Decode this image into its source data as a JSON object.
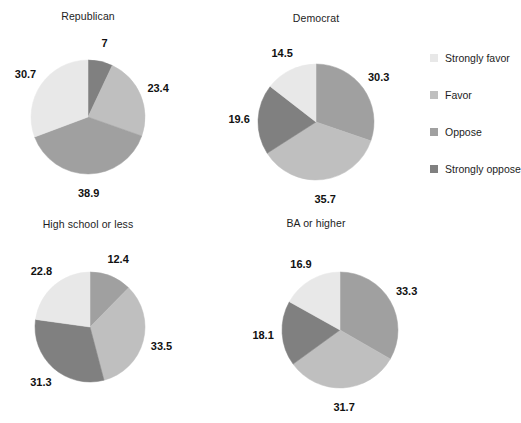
{
  "chart_data": {
    "type": "pie",
    "title": "",
    "legend_position": "right",
    "legend": {
      "entries": [
        {
          "label": "Strongly favor",
          "color": "#e8e8e8"
        },
        {
          "label": "Favor",
          "color": "#bfbfbf"
        },
        {
          "label": "Oppose",
          "color": "#a0a0a0"
        },
        {
          "label": "Strongly oppose",
          "color": "#808080"
        }
      ]
    },
    "categories": [
      "Strongly favor",
      "Favor",
      "Oppose",
      "Strongly oppose"
    ],
    "colors": [
      "#e8e8e8",
      "#bfbfbf",
      "#a0a0a0",
      "#808080"
    ],
    "panels": [
      {
        "title": "Republican",
        "values": [
          30.7,
          23.4,
          38.9,
          7
        ],
        "slices": [
          {
            "label": "7",
            "category": "Strongly oppose",
            "value": 7,
            "color": "#808080"
          },
          {
            "label": "23.4",
            "category": "Favor",
            "value": 23.4,
            "color": "#bfbfbf"
          },
          {
            "label": "38.9",
            "category": "Oppose",
            "value": 38.9,
            "color": "#a0a0a0"
          },
          {
            "label": "30.7",
            "category": "Strongly favor",
            "value": 30.7,
            "color": "#e8e8e8"
          }
        ]
      },
      {
        "title": "Democrat",
        "values": [
          14.5,
          35.7,
          30.3,
          19.6
        ],
        "slices": [
          {
            "label": "30.3",
            "category": "Oppose",
            "value": 30.3,
            "color": "#a0a0a0"
          },
          {
            "label": "35.7",
            "category": "Favor",
            "value": 35.7,
            "color": "#bfbfbf"
          },
          {
            "label": "19.6",
            "category": "Strongly oppose",
            "value": 19.6,
            "color": "#808080"
          },
          {
            "label": "14.5",
            "category": "Strongly favor",
            "value": 14.5,
            "color": "#e8e8e8"
          }
        ]
      },
      {
        "title": "High school or less",
        "values": [
          22.8,
          33.5,
          12.4,
          31.3
        ],
        "slices": [
          {
            "label": "12.4",
            "category": "Oppose",
            "value": 12.4,
            "color": "#a0a0a0"
          },
          {
            "label": "33.5",
            "category": "Favor",
            "value": 33.5,
            "color": "#bfbfbf"
          },
          {
            "label": "31.3",
            "category": "Strongly oppose",
            "value": 31.3,
            "color": "#808080"
          },
          {
            "label": "22.8",
            "category": "Strongly favor",
            "value": 22.8,
            "color": "#e8e8e8"
          }
        ]
      },
      {
        "title": "BA or higher",
        "values": [
          16.9,
          31.7,
          33.3,
          18.1
        ],
        "slices": [
          {
            "label": "33.3",
            "category": "Oppose",
            "value": 33.3,
            "color": "#a0a0a0"
          },
          {
            "label": "31.7",
            "category": "Favor",
            "value": 31.7,
            "color": "#bfbfbf"
          },
          {
            "label": "18.1",
            "category": "Strongly oppose",
            "value": 18.1,
            "color": "#808080"
          },
          {
            "label": "16.9",
            "category": "Strongly favor",
            "value": 16.9,
            "color": "#e8e8e8"
          }
        ]
      }
    ]
  },
  "layout": {
    "panel_geometry": [
      {
        "cx": 88,
        "cy": 117,
        "r": 57,
        "title_y": 10,
        "label_radius": 76
      },
      {
        "cx": 316,
        "cy": 122,
        "r": 58,
        "title_y": 12,
        "label_radius": 77
      },
      {
        "cx": 90,
        "cy": 327,
        "r": 55,
        "title_y": 218,
        "label_radius": 74
      },
      {
        "cx": 340,
        "cy": 330,
        "r": 58,
        "title_y": 217,
        "label_radius": 77
      }
    ]
  }
}
